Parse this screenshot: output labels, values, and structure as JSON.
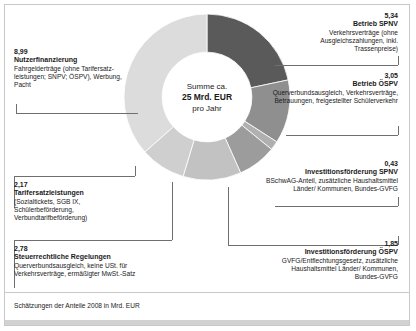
{
  "center": {
    "line1": "Summe ca.",
    "line2": "25 Mrd. EUR",
    "line3": "pro Jahr"
  },
  "footnote": "Schätzungen der Anteile 2008 in Mrd. EUR",
  "callouts": {
    "nutzerfinanzierung": {
      "value": "8,99",
      "title": "Nutzerfinanzierung",
      "desc": "Fahrgelderträge (ohne Tarifersatz-leistungen; SNPV; ÖSPV), Werbung, Pacht"
    },
    "tarifersatzleistungen": {
      "value": "2,17",
      "title": "Tarifersatzleistungen",
      "desc": "(Sozialtickets, SGB IX, Schülerbeförderung, Verbundtarifbeförderung)"
    },
    "steuerrechtliche": {
      "value": "2,78",
      "title": "Steuerrechtliche Regelungen",
      "desc": "Querverbundsausgleich, keine USt. für Verkehrsverträge, ermäßigter MwSt.-Satz"
    },
    "betrieb_spnv": {
      "value": "5,34",
      "title": "Betrieb SPNV",
      "desc": "Verkehrsverträge (ohne Ausgleichszahlungen, inkl. Trassenpreise)"
    },
    "betrieb_oespv": {
      "value": "3,05",
      "title": "Betrieb ÖSPV",
      "desc": "Querverbundsausgleich, Verkehrsverträge, Betrauungen, freigestellter Schülerverkehr"
    },
    "invest_spnv": {
      "value": "0,43",
      "title": "Investitionsförderung SPNV",
      "desc": "BSchwAG-Anteil, zusätzliche Haushaltsmittel Länder/ Kommunen, Bundes-GVFG"
    },
    "invest_oespv": {
      "value": "1,85",
      "title": "Investitionsförderung ÖSPV",
      "desc": "GVFG/Entflechtungsgesetz, zusätzliche Haushaltsmittel Länder/ Kommunen, Bundes-GVFG"
    }
  },
  "chart_data": {
    "type": "pie",
    "variant": "donut",
    "title": "Summe ca. 25 Mrd. EUR pro Jahr",
    "subtitle": "Schätzungen der Anteile 2008 in Mrd. EUR",
    "unit": "Mrd. EUR",
    "total": 24.61,
    "total_label": "25 Mrd. EUR",
    "legend": "callouts",
    "start_angle_deg": 0,
    "direction": "clockwise",
    "inner_radius_ratio": 0.54,
    "categories": [
      "Betrieb SPNV",
      "Betrieb ÖSPV",
      "Investitionsförderung SPNV",
      "Investitionsförderung ÖSPV",
      "Steuerrechtliche Regelungen",
      "Tarifersatzleistungen",
      "Nutzerfinanzierung"
    ],
    "values": [
      5.34,
      3.05,
      0.43,
      1.85,
      2.78,
      2.17,
      8.99
    ],
    "colors": [
      "#5a5a5a",
      "#8f8f8f",
      "#b0b0b0",
      "#9c9c9c",
      "#c2c2c2",
      "#cfcfcf",
      "#dcdcdc"
    ],
    "slices": [
      {
        "label": "Betrieb SPNV",
        "value": 5.34,
        "color": "#5a5a5a"
      },
      {
        "label": "Betrieb ÖSPV",
        "value": 3.05,
        "color": "#8f8f8f"
      },
      {
        "label": "Investitionsförderung SPNV",
        "value": 0.43,
        "color": "#b0b0b0"
      },
      {
        "label": "Investitionsförderung ÖSPV",
        "value": 1.85,
        "color": "#9c9c9c"
      },
      {
        "label": "Steuerrechtliche Regelungen",
        "value": 2.78,
        "color": "#c2c2c2"
      },
      {
        "label": "Tarifersatzleistungen",
        "value": 2.17,
        "color": "#cfcfcf"
      },
      {
        "label": "Nutzerfinanzierung",
        "value": 8.99,
        "color": "#dcdcdc"
      }
    ]
  }
}
